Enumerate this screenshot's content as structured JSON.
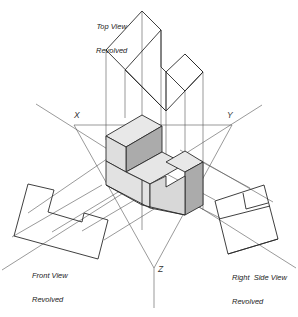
{
  "figure": {
    "type": "technical-projection-drawing"
  },
  "labels": {
    "top_view": {
      "line1": "Top View",
      "line2": "Revolved"
    },
    "front_view": {
      "line1": "Front View",
      "line2": "Revolved"
    },
    "right_side_view": {
      "line1": "Right  Side View",
      "line2": "Revolved"
    }
  },
  "axes": {
    "x": "X",
    "y": "Y",
    "z": "Z"
  },
  "colors": {
    "line": "#2a2a2a",
    "thin_line": "#555555",
    "light_face": "#e6e6e6",
    "mid_face": "#d4d4d4",
    "dark_face": "#aaaaaa"
  }
}
